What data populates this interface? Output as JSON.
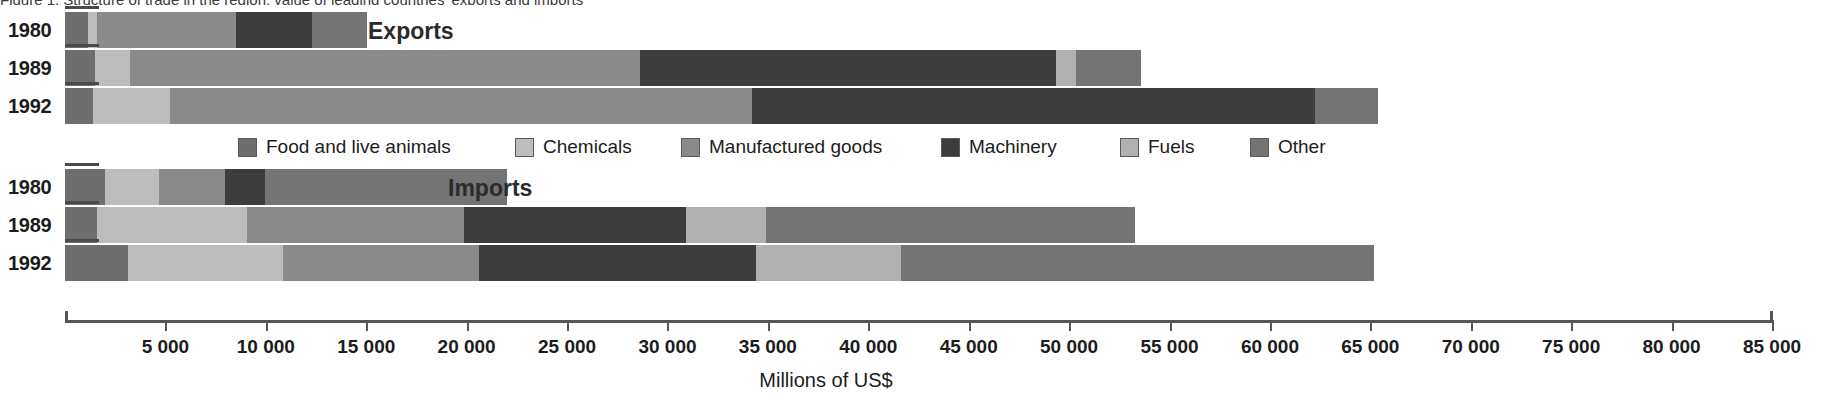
{
  "caption": {
    "text": "Figure 1.  Structure of trade in the region: value of leading countries' exports and imports"
  },
  "chart_data": {
    "type": "bar",
    "orientation": "horizontal",
    "stacked": true,
    "title": "",
    "xlabel": "Millions of US$",
    "ylabel": "",
    "xlim": [
      0,
      85000
    ],
    "grid": false,
    "legend_position": "middle-center",
    "tick_labels": [
      "",
      "5 000",
      "10 000",
      "15 000",
      "20 000",
      "25 000",
      "30 000",
      "35 000",
      "40 000",
      "45 000",
      "50 000",
      "55 000",
      "60 000",
      "65 000",
      "70 000",
      "75 000",
      "80 000",
      "85 000"
    ],
    "tick_values": [
      0,
      5000,
      10000,
      15000,
      20000,
      25000,
      30000,
      35000,
      40000,
      45000,
      50000,
      55000,
      60000,
      65000,
      70000,
      75000,
      80000,
      85000
    ],
    "series": [
      {
        "name": "Food and live animals",
        "color": "#6e6e6e"
      },
      {
        "name": "Chemicals",
        "color": "#bdbdbd"
      },
      {
        "name": "Manufactured goods",
        "color": "#8a8a8a"
      },
      {
        "name": "Machinery",
        "color": "#3d3d3d"
      },
      {
        "name": "Fuels",
        "color": "#b0b0b0"
      },
      {
        "name": "Other",
        "color": "#747474"
      }
    ],
    "groups": [
      {
        "label": "Exports",
        "categories": [
          "1980",
          "1989",
          "1992"
        ],
        "values": [
          [
            1150,
            200,
            6900,
            3800,
            0,
            2750
          ],
          [
            1500,
            1750,
            25400,
            20700,
            1000,
            3250
          ],
          [
            1400,
            3850,
            29000,
            28050,
            0,
            3150
          ]
        ],
        "totals": [
          14800,
          53600,
          65450
        ]
      },
      {
        "label": "Imports",
        "categories": [
          "1980",
          "1989",
          "1992"
        ],
        "values": [
          [
            2000,
            2700,
            3300,
            2000,
            0,
            12050
          ],
          [
            1600,
            7450,
            10800,
            11050,
            4000,
            18400
          ],
          [
            3150,
            7700,
            9750,
            13800,
            7200,
            23550
          ]
        ],
        "totals": [
          22050,
          53300,
          65150
        ]
      }
    ]
  },
  "legend": {
    "items": [
      {
        "label": "Food and live animals",
        "color": "#6e6e6e",
        "x": 0
      },
      {
        "label": "Chemicals",
        "color": "#bdbdbd",
        "x": 277
      },
      {
        "label": "Manufactured goods",
        "color": "#8a8a8a",
        "x": 443
      },
      {
        "label": "Machinery",
        "color": "#3d3d3d",
        "x": 703
      },
      {
        "label": "Fuels",
        "color": "#b0b0b0",
        "x": 882
      },
      {
        "label": "Other",
        "color": "#747474",
        "x": 1012
      }
    ]
  },
  "rows": [
    {
      "year": "1980",
      "group": "Exports",
      "y": 12,
      "segments": [
        {
          "c": "#6e6e6e",
          "w": 23
        },
        {
          "c": "#bdbdbd",
          "w": 9
        },
        {
          "c": "#8a8a8a",
          "w": 139
        },
        {
          "c": "#3d3d3d",
          "w": 76
        },
        {
          "c": "#747474",
          "w": 55
        }
      ]
    },
    {
      "year": "1989",
      "group": "Exports",
      "y": 50,
      "segments": [
        {
          "c": "#6e6e6e",
          "w": 30
        },
        {
          "c": "#bdbdbd",
          "w": 35
        },
        {
          "c": "#8a8a8a",
          "w": 510
        },
        {
          "c": "#3d3d3d",
          "w": 416
        },
        {
          "c": "#b0b0b0",
          "w": 20
        },
        {
          "c": "#747474",
          "w": 65
        }
      ]
    },
    {
      "year": "1992",
      "group": "Exports",
      "y": 88,
      "segments": [
        {
          "c": "#6e6e6e",
          "w": 28
        },
        {
          "c": "#bdbdbd",
          "w": 77
        },
        {
          "c": "#8a8a8a",
          "w": 582
        },
        {
          "c": "#3d3d3d",
          "w": 563
        },
        {
          "c": "#747474",
          "w": 63
        }
      ]
    },
    {
      "year": "1980",
      "group": "Imports",
      "y": 169,
      "segments": [
        {
          "c": "#6e6e6e",
          "w": 40
        },
        {
          "c": "#bdbdbd",
          "w": 54
        },
        {
          "c": "#8a8a8a",
          "w": 66
        },
        {
          "c": "#3d3d3d",
          "w": 40
        },
        {
          "c": "#747474",
          "w": 242
        }
      ]
    },
    {
      "year": "1989",
      "group": "Imports",
      "y": 207,
      "segments": [
        {
          "c": "#6e6e6e",
          "w": 32
        },
        {
          "c": "#bdbdbd",
          "w": 150
        },
        {
          "c": "#8a8a8a",
          "w": 217
        },
        {
          "c": "#3d3d3d",
          "w": 222
        },
        {
          "c": "#b0b0b0",
          "w": 80
        },
        {
          "c": "#747474",
          "w": 369
        }
      ]
    },
    {
      "year": "1992",
      "group": "Imports",
      "y": 245,
      "segments": [
        {
          "c": "#6e6e6e",
          "w": 63
        },
        {
          "c": "#bdbdbd",
          "w": 155
        },
        {
          "c": "#8a8a8a",
          "w": 196
        },
        {
          "c": "#3d3d3d",
          "w": 277
        },
        {
          "c": "#b0b0b0",
          "w": 145
        },
        {
          "c": "#747474",
          "w": 473
        }
      ]
    }
  ],
  "group_titles": [
    {
      "label": "Exports",
      "x": 368,
      "y": 18
    },
    {
      "label": "Imports",
      "x": 448,
      "y": 175
    }
  ]
}
